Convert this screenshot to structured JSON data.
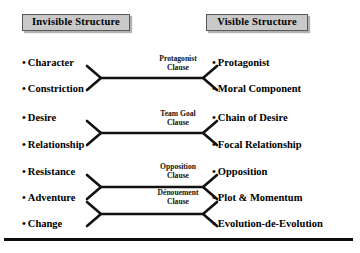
{
  "diagram": {
    "title_left": "Invisible Structure",
    "title_right": "Visible Structure",
    "colors": {
      "header_fill": "#c9c9c9",
      "header_border": "#5a5a5a",
      "text": "#000000",
      "arrow": "#111111",
      "rule": "#0d0d0d",
      "background": "#ffffff"
    },
    "left_items": [
      {
        "bullet": "•",
        "label": "Character"
      },
      {
        "bullet": "•",
        "label": "Constriction"
      },
      {
        "bullet": "•",
        "label": "Desire"
      },
      {
        "bullet": "•",
        "label": "Relationship"
      },
      {
        "bullet": "•",
        "label": "Resistance"
      },
      {
        "bullet": "•",
        "label": "Adventure"
      },
      {
        "bullet": "•",
        "label": "Change"
      }
    ],
    "right_items": [
      {
        "bullet": "•",
        "label": "Protagonist"
      },
      {
        "bullet": "•",
        "label": "Moral Component"
      },
      {
        "bullet": "•",
        "label": "Chain of Desire"
      },
      {
        "bullet": "•",
        "label": "Focal Relationship"
      },
      {
        "bullet": "•",
        "label": "Opposition"
      },
      {
        "bullet": "•",
        "label": "Plot & Momentum"
      },
      {
        "bullet": "•",
        "label": "Evolution-de-Evolution"
      }
    ],
    "clauses": [
      {
        "line1": "Protagonist",
        "line2": "Clause"
      },
      {
        "line1": "Team Goal",
        "line2": "Clause"
      },
      {
        "line1": "Opposition",
        "line2": "Clause"
      },
      {
        "line1": "Dénouement",
        "line2": "Clause"
      }
    ]
  }
}
